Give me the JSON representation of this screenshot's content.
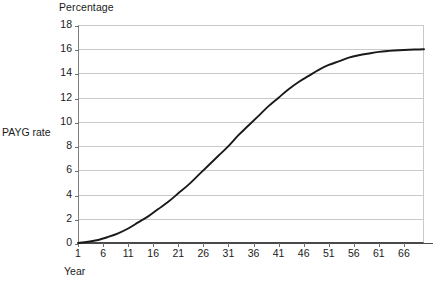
{
  "chart_data": {
    "type": "line",
    "title": "Percentage",
    "xlabel": "Year",
    "ylabel": "PAYG rate",
    "grid": true,
    "legend": false,
    "xlim": [
      1,
      70
    ],
    "ylim": [
      0,
      18
    ],
    "xticks": [
      1,
      6,
      11,
      16,
      21,
      26,
      31,
      36,
      41,
      46,
      51,
      56,
      61,
      66
    ],
    "yticks": [
      0,
      2,
      4,
      6,
      8,
      10,
      12,
      14,
      16,
      18
    ],
    "line_color": "#1a1a1a",
    "series": [
      {
        "name": "PAYG rate",
        "x": [
          1,
          3,
          5,
          7,
          9,
          11,
          13,
          15,
          17,
          19,
          21,
          23,
          25,
          27,
          29,
          31,
          33,
          35,
          37,
          39,
          41,
          43,
          45,
          47,
          49,
          51,
          53,
          55,
          57,
          59,
          61,
          63,
          65,
          67,
          69,
          70
        ],
        "values": [
          0.0,
          0.1,
          0.25,
          0.5,
          0.8,
          1.2,
          1.7,
          2.2,
          2.8,
          3.4,
          4.1,
          4.8,
          5.6,
          6.4,
          7.2,
          8.0,
          8.9,
          9.7,
          10.5,
          11.3,
          12.0,
          12.7,
          13.3,
          13.8,
          14.3,
          14.7,
          15.0,
          15.3,
          15.5,
          15.65,
          15.78,
          15.86,
          15.92,
          15.96,
          15.98,
          16.0
        ]
      }
    ]
  },
  "axes": {
    "title": "Percentage",
    "y_title": "PAYG rate",
    "x_title": "Year"
  }
}
